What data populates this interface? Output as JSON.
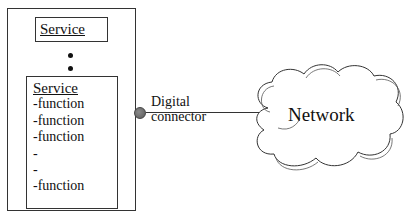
{
  "diagram": {
    "device": {
      "top_service": {
        "label": "Service"
      },
      "ellipsis_dots": 2,
      "service_detail": {
        "title": "Service",
        "items": [
          "-function",
          "-function",
          "-function",
          "-",
          "-",
          "-function"
        ]
      }
    },
    "connector": {
      "label_line1": "Digital",
      "label_line2": "connector"
    },
    "network": {
      "label": "Network"
    }
  }
}
